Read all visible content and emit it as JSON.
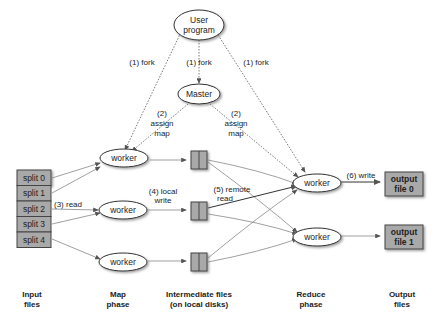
{
  "nodes": {
    "user_program": {
      "line1": "User",
      "line2": "program"
    },
    "master": "Master",
    "map_workers": [
      "worker",
      "worker",
      "worker"
    ],
    "reduce_workers": [
      "worker",
      "worker"
    ],
    "splits": [
      "split 0",
      "split 1",
      "split 2",
      "split 3",
      "split 4"
    ],
    "outputs": [
      {
        "line1": "output",
        "line2": "file 0"
      },
      {
        "line1": "output",
        "line2": "file 1"
      }
    ]
  },
  "edge_labels": {
    "fork_left": "(1) fork",
    "fork_mid": "(1) fork",
    "fork_right": "(1) fork",
    "assign_map_left": {
      "line1": "(2)",
      "line2": "assign",
      "line3": "map"
    },
    "assign_map_right": {
      "line1": "(2)",
      "line2": "assign",
      "line3": "map"
    },
    "read": "(3) read",
    "local_write": {
      "line1": "(4) local",
      "line2": "write"
    },
    "remote_read": {
      "line1": "(5) remote",
      "line2": "read"
    },
    "write": "(6) write"
  },
  "phases": [
    {
      "line1": "Input",
      "line2": "files"
    },
    {
      "line1": "Map",
      "line2": "phase"
    },
    {
      "line1": "Intermediate files",
      "line2": "(on local disks)"
    },
    {
      "line1": "Reduce",
      "line2": "phase"
    },
    {
      "line1": "Output",
      "line2": "files"
    }
  ],
  "colors": {
    "box_fill": "#a9a9a9",
    "line": "#777777",
    "text": "#222222"
  }
}
